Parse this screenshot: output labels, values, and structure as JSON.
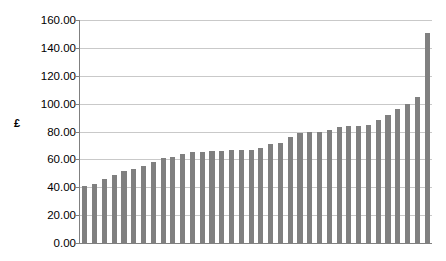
{
  "chart_data": {
    "type": "bar",
    "title": "",
    "subtitle": "",
    "xlabel": "",
    "ylabel": "£",
    "ylim": [
      0,
      160
    ],
    "ytick_step": 20,
    "ytick_labels": [
      "0.00",
      "20.00",
      "40.00",
      "60.00",
      "80.00",
      "100.00",
      "120.00",
      "140.00",
      "160.00"
    ],
    "ytick_values": [
      0,
      20,
      40,
      60,
      80,
      100,
      120,
      140,
      160
    ],
    "xtick_labels": [],
    "grid": "horizontal",
    "legend": "none",
    "bar_color": "#808080",
    "axis_color": "#808080",
    "gridline_color": "#c9c9c9",
    "background_color": "#ffffff",
    "categories": [
      "1",
      "2",
      "3",
      "4",
      "5",
      "6",
      "7",
      "8",
      "9",
      "10",
      "11",
      "12",
      "13",
      "14",
      "15",
      "16",
      "17",
      "18",
      "19",
      "20",
      "21",
      "22",
      "23",
      "24",
      "25",
      "26",
      "27",
      "28",
      "29",
      "30",
      "31",
      "32",
      "33",
      "34",
      "35",
      "36"
    ],
    "values": [
      41,
      42,
      46,
      49,
      52,
      53,
      55,
      58,
      61,
      62,
      64,
      65,
      65,
      66,
      66,
      67,
      67,
      67,
      68,
      71,
      72,
      76,
      79,
      80,
      80,
      81,
      83,
      84,
      84,
      85,
      88,
      92,
      96,
      100,
      105,
      151
    ]
  }
}
